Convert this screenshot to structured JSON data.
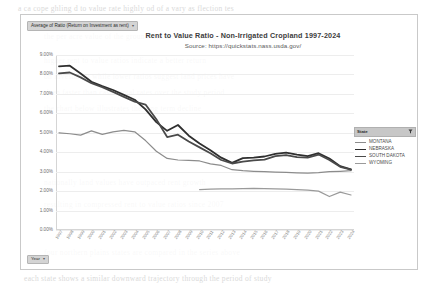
{
  "field_pill": {
    "label": "Average of Ratio (Return on Investment as rent)",
    "caret": "▾"
  },
  "year_pill": {
    "label": "Year",
    "caret": "▾"
  },
  "title": "Rent to Value Ratio - Non-Irrigated Cropland  1997-2024",
  "subtitle": "Source: https://quickstats.nass.usda.gov/",
  "legend": {
    "header": "State",
    "filter_icon": "filter-icon",
    "entries": [
      {
        "label": "MONTANA",
        "color": "#8c8c8c",
        "width": 1.2
      },
      {
        "label": "NEBRASKA",
        "color": "#2f2f2f",
        "width": 1.8
      },
      {
        "label": "SOUTH DAKOTA",
        "color": "#4a4a4a",
        "width": 1.8
      },
      {
        "label": "WYOMING",
        "color": "#9a9a9a",
        "width": 1.2
      }
    ]
  },
  "chart_data": {
    "type": "line",
    "title": "Rent to Value Ratio - Non-Irrigated Cropland  1997-2024",
    "subtitle": "Source: https://quickstats.nass.usda.gov/",
    "xlabel": "Year",
    "ylabel": "Average of Ratio (Return on Investment as rent)",
    "ylim": [
      0,
      9
    ],
    "yticks": [
      9,
      8,
      7,
      6,
      5,
      4,
      3,
      2,
      1,
      0
    ],
    "ytick_labels": [
      "9.00%",
      "8.00%",
      "7.00%",
      "6.00%",
      "5.00%",
      "4.00%",
      "3.00%",
      "2.00%",
      "1.00%",
      "0.00%"
    ],
    "grid": true,
    "legend_position": "right",
    "x": [
      1997,
      1998,
      1999,
      2000,
      2001,
      2002,
      2003,
      2004,
      2005,
      2006,
      2007,
      2008,
      2009,
      2010,
      2011,
      2012,
      2013,
      2014,
      2015,
      2016,
      2017,
      2018,
      2019,
      2020,
      2021,
      2022,
      2023,
      2024
    ],
    "series": [
      {
        "name": "MONTANA",
        "color": "#8c8c8c",
        "values": [
          5.0,
          4.95,
          4.88,
          5.1,
          4.92,
          5.05,
          5.12,
          5.05,
          4.6,
          4.05,
          3.68,
          3.6,
          3.58,
          3.55,
          3.4,
          3.32,
          3.1,
          3.05,
          3.02,
          3.0,
          2.98,
          2.96,
          2.94,
          2.93,
          2.95,
          3.0,
          3.02,
          3.05
        ]
      },
      {
        "name": "NEBRASKA",
        "color": "#2f2f2f",
        "values": [
          8.42,
          8.45,
          8.05,
          7.62,
          7.4,
          7.2,
          6.95,
          6.7,
          6.2,
          5.55,
          5.1,
          5.4,
          4.85,
          4.45,
          4.1,
          3.72,
          3.45,
          3.7,
          3.72,
          3.78,
          3.92,
          3.98,
          3.88,
          3.8,
          3.95,
          3.68,
          3.28,
          3.12
        ]
      },
      {
        "name": "SOUTH DAKOTA",
        "color": "#4a4a4a",
        "values": [
          8.05,
          8.1,
          7.85,
          7.55,
          7.35,
          7.1,
          6.85,
          6.6,
          6.45,
          5.7,
          4.78,
          4.9,
          4.55,
          4.25,
          3.95,
          3.6,
          3.42,
          3.52,
          3.58,
          3.62,
          3.8,
          3.85,
          3.75,
          3.72,
          3.88,
          3.6,
          3.25,
          3.1
        ]
      },
      {
        "name": "WYOMING",
        "color": "#9a9a9a",
        "values": [
          null,
          null,
          null,
          null,
          null,
          null,
          null,
          null,
          null,
          null,
          null,
          null,
          null,
          2.08,
          2.1,
          2.12,
          2.12,
          2.13,
          2.14,
          2.13,
          2.12,
          2.1,
          2.08,
          2.05,
          2.0,
          1.72,
          1.95,
          1.8
        ]
      }
    ]
  },
  "ghost_text": [
    {
      "x": 18,
      "y": 4,
      "t": "a   ca  cope  ghling  d  to  value  rate  highly  od     of   a    vary  as  flection  tes"
    },
    {
      "x": 44,
      "y": 32,
      "t": "the   per  acre  value   of  the  ground  and  the  rent  it  can  generate"
    },
    {
      "x": 44,
      "y": 56,
      "t": "higher   rent    to   value     ratios      indicate     a    better    return"
    },
    {
      "x": 44,
      "y": 72,
      "t": "on  investment   while   lower    ratios   suggest    land   prices   have"
    },
    {
      "x": 44,
      "y": 88,
      "t": "risen   faster   than   cash   rental   rates   over   the   study   period"
    },
    {
      "x": 44,
      "y": 104,
      "t": "the    chart     below    illustrates    the   long    term    decline"
    },
    {
      "x": 44,
      "y": 178,
      "t": "nationally       land    values      have     outpaced    rent     growth"
    },
    {
      "x": 44,
      "y": 200,
      "t": "resulting    in   compressed     rent    to    value     ratios    since   2007"
    },
    {
      "x": 44,
      "y": 248,
      "t": "four   northern   plains   states   are   compared   in   the   series   above"
    },
    {
      "x": 24,
      "y": 274,
      "t": "each   state   shows   a   similar   downward   trajectory   through   the   period   of   study"
    }
  ]
}
